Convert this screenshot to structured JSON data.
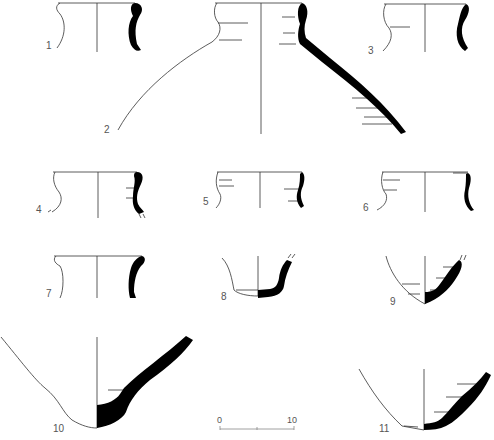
{
  "figure": {
    "type": "pottery-profile-plate",
    "ink_color": "#000000",
    "line_color": "#333333",
    "background": "#ffffff"
  },
  "vessels": [
    {
      "id": 1,
      "label": "1",
      "kind": "jar rim, everted"
    },
    {
      "id": 2,
      "label": "2",
      "kind": "large jar, neck and shoulder"
    },
    {
      "id": 3,
      "label": "3",
      "kind": "jar rim, everted"
    },
    {
      "id": 4,
      "label": "4",
      "kind": "jar rim"
    },
    {
      "id": 5,
      "label": "5",
      "kind": "jar rim"
    },
    {
      "id": 6,
      "label": "6",
      "kind": "jar rim"
    },
    {
      "id": 7,
      "label": "7",
      "kind": "jar rim, upright"
    },
    {
      "id": 8,
      "label": "8",
      "kind": "base, flat"
    },
    {
      "id": 9,
      "label": "9",
      "kind": "base, rounded"
    },
    {
      "id": 10,
      "label": "10",
      "kind": "base, thick"
    },
    {
      "id": 11,
      "label": "11",
      "kind": "base"
    }
  ],
  "scale_bar": {
    "start_label": "0",
    "end_label": "10"
  }
}
